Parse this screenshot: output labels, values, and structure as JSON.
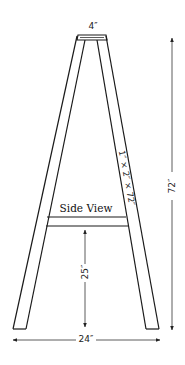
{
  "diagram": {
    "title": "Side View",
    "labels": {
      "top_width": "4″",
      "leg_size": "1″ × 2″ × 72″",
      "height": "72″",
      "crossbar_height": "25″",
      "base_width": "24″"
    },
    "colors": {
      "line": "#1a1a1a",
      "background": "#ffffff"
    }
  }
}
